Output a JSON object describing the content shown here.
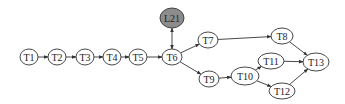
{
  "nodes": [
    {
      "id": "T1",
      "label": "T1",
      "cx": 29,
      "cy": 57,
      "rx": 9,
      "ry": 8,
      "fill": "#ffffff"
    },
    {
      "id": "T2",
      "label": "T2",
      "cx": 57,
      "cy": 57,
      "rx": 9,
      "ry": 8,
      "fill": "#ffffff"
    },
    {
      "id": "T3",
      "label": "T3",
      "cx": 85,
      "cy": 57,
      "rx": 9,
      "ry": 8,
      "fill": "#ffffff"
    },
    {
      "id": "T4",
      "label": "T4",
      "cx": 112,
      "cy": 57,
      "rx": 9,
      "ry": 8,
      "fill": "#ffffff"
    },
    {
      "id": "T5",
      "label": "T5",
      "cx": 138,
      "cy": 57,
      "rx": 9,
      "ry": 8,
      "fill": "#ffffff"
    },
    {
      "id": "T6",
      "label": "T6",
      "cx": 172,
      "cy": 57,
      "rx": 10,
      "ry": 8,
      "fill": "#ffffff"
    },
    {
      "id": "L21",
      "label": "L21",
      "cx": 172,
      "cy": 18,
      "rx": 12,
      "ry": 10,
      "fill": "#8c8c8c"
    },
    {
      "id": "T7",
      "label": "T7",
      "cx": 208,
      "cy": 40,
      "rx": 10,
      "ry": 8,
      "fill": "#ffffff"
    },
    {
      "id": "T8",
      "label": "T8",
      "cx": 282,
      "cy": 36,
      "rx": 11,
      "ry": 8,
      "fill": "#ffffff"
    },
    {
      "id": "T9",
      "label": "T9",
      "cx": 209,
      "cy": 79,
      "rx": 10,
      "ry": 8,
      "fill": "#ffffff"
    },
    {
      "id": "T10",
      "label": "T10",
      "cx": 245,
      "cy": 76,
      "rx": 14,
      "ry": 9,
      "fill": "#ffffff"
    },
    {
      "id": "T11",
      "label": "T11",
      "cx": 271,
      "cy": 61,
      "rx": 13,
      "ry": 8,
      "fill": "#ffffff"
    },
    {
      "id": "T12",
      "label": "T12",
      "cx": 282,
      "cy": 91,
      "rx": 13,
      "ry": 8,
      "fill": "#ffffff"
    },
    {
      "id": "T13",
      "label": "T13",
      "cx": 316,
      "cy": 62,
      "rx": 13,
      "ry": 9,
      "fill": "#ffffff"
    }
  ],
  "edges": [
    {
      "from": "T1",
      "to": "T2"
    },
    {
      "from": "T2",
      "to": "T3"
    },
    {
      "from": "T3",
      "to": "T4"
    },
    {
      "from": "T4",
      "to": "T5"
    },
    {
      "from": "T5",
      "to": "T6"
    },
    {
      "from": "T6",
      "to": "L21",
      "bidirectional": true
    },
    {
      "from": "T6",
      "to": "T7"
    },
    {
      "from": "T6",
      "to": "T9"
    },
    {
      "from": "T7",
      "to": "T8"
    },
    {
      "from": "T9",
      "to": "T10"
    },
    {
      "from": "T10",
      "to": "T11"
    },
    {
      "from": "T10",
      "to": "T12"
    },
    {
      "from": "T8",
      "to": "T13"
    },
    {
      "from": "T11",
      "to": "T13"
    },
    {
      "from": "T12",
      "to": "T13"
    }
  ],
  "style": {
    "stroke": "#333333",
    "background": "#ffffff"
  }
}
